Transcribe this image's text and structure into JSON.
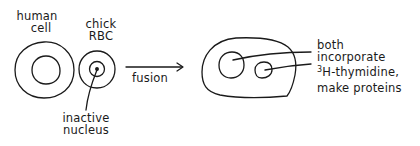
{
  "diagram": {
    "type": "cell-fusion-schematic",
    "stroke_color": "#1a1a1a",
    "background": "#ffffff",
    "cells": {
      "human_cell": {
        "label_line1": "human",
        "label_line2": "cell"
      },
      "chick_rbc": {
        "label_line1": "chick",
        "label_line2": "RBC",
        "nucleus_label_line1": "inactive",
        "nucleus_label_line2": "nucleus"
      },
      "fused_cell": {
        "annotation_line1": "both",
        "annotation_line2": "incorporate",
        "annotation_line3_sup": "3",
        "annotation_line3": "H-thymidine,",
        "annotation_line4": "make proteins"
      }
    },
    "process_arrow": {
      "label": "fusion",
      "icon": "right-arrow-icon"
    }
  }
}
